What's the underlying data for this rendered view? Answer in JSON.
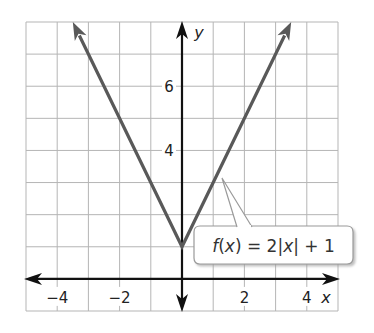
{
  "chart_data": {
    "type": "line",
    "title": "",
    "function_label": "f(x) = 2|x| + 1",
    "xlabel": "x",
    "ylabel": "y",
    "xlim": [
      -5,
      5
    ],
    "ylim": [
      -1,
      8
    ],
    "x_ticks_labeled": [
      -4,
      -2,
      2,
      4
    ],
    "y_ticks_labeled": [
      4,
      6
    ],
    "x_tick_labels": [
      "−4",
      "−2",
      "2",
      "4"
    ],
    "y_tick_labels": [
      "4",
      "6"
    ],
    "grid": true,
    "grid_step": 1,
    "series": [
      {
        "name": "f(x) = 2|x| + 1",
        "x": [
          -3.5,
          0,
          3.5
        ],
        "y": [
          8,
          1,
          8
        ],
        "arrows_at_ends": true,
        "color": "#595959"
      }
    ],
    "vertex": [
      0,
      1
    ]
  },
  "colors": {
    "grid": "#b5b5b5",
    "axis": "#111111",
    "line": "#595959",
    "label_border": "#9a9a9a"
  }
}
